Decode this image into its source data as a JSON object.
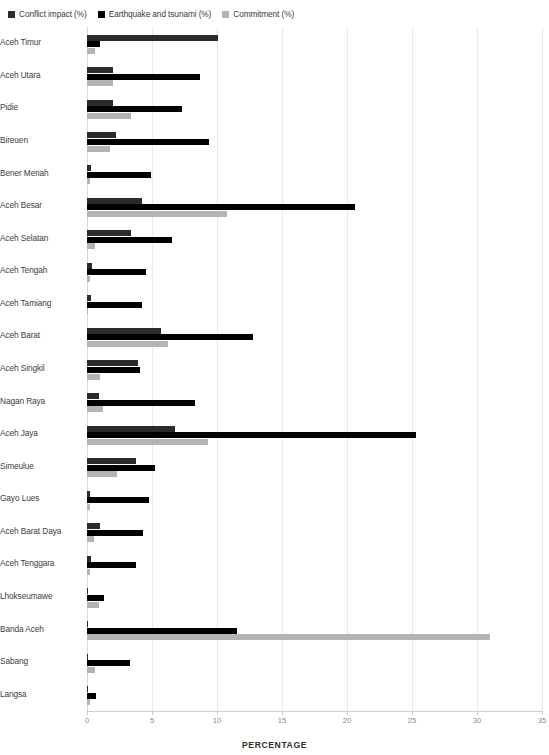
{
  "chart_data": {
    "type": "bar",
    "orientation": "horizontal",
    "title": "",
    "xlabel": "PERCENTAGE",
    "ylabel": "",
    "xlim": [
      0,
      35
    ],
    "xticks": [
      0,
      5,
      10,
      15,
      20,
      25,
      30,
      35
    ],
    "grid": true,
    "legend_position": "top-left",
    "categories": [
      "Aceh Timur",
      "Aceh Utara",
      "Pidie",
      "Bireuen",
      "Bener Meriah",
      "Aceh Besar",
      "Aceh Selatan",
      "Aceh Tengah",
      "Aceh Tamiang",
      "Aceh Barat",
      "Aceh Singkil",
      "Nagan Raya",
      "Aceh Jaya",
      "Simeulue",
      "Gayo Lues",
      "Aceh Barat Daya",
      "Aceh Tenggara",
      "Lhokseumawe",
      "Banda Aceh",
      "Sabang",
      "Langsa"
    ],
    "series": [
      {
        "name": "Conflict impact (%)",
        "color": "#2b2b2b",
        "values": [
          10.1,
          2.0,
          2.0,
          2.2,
          0.3,
          4.2,
          3.4,
          0.4,
          0.3,
          5.7,
          3.9,
          0.9,
          6.8,
          3.8,
          0.2,
          1.0,
          0.3,
          0.1,
          0.1,
          0.1,
          0.1
        ]
      },
      {
        "name": "Earthquake and tsunami (%)",
        "color": "#000000",
        "values": [
          1.0,
          8.7,
          7.3,
          9.4,
          4.9,
          20.6,
          6.5,
          4.5,
          4.2,
          12.8,
          4.1,
          8.3,
          25.3,
          5.2,
          4.8,
          4.3,
          3.8,
          1.3,
          11.5,
          3.3,
          0.7
        ]
      },
      {
        "name": "Commitment (%)",
        "color": "#b3b3b3",
        "values": [
          0.6,
          2.0,
          3.4,
          1.8,
          0.2,
          10.8,
          0.6,
          0.2,
          0.1,
          6.2,
          1.0,
          1.2,
          9.3,
          2.3,
          0.2,
          0.5,
          0.2,
          0.9,
          31.0,
          0.6,
          0.2
        ]
      }
    ]
  }
}
